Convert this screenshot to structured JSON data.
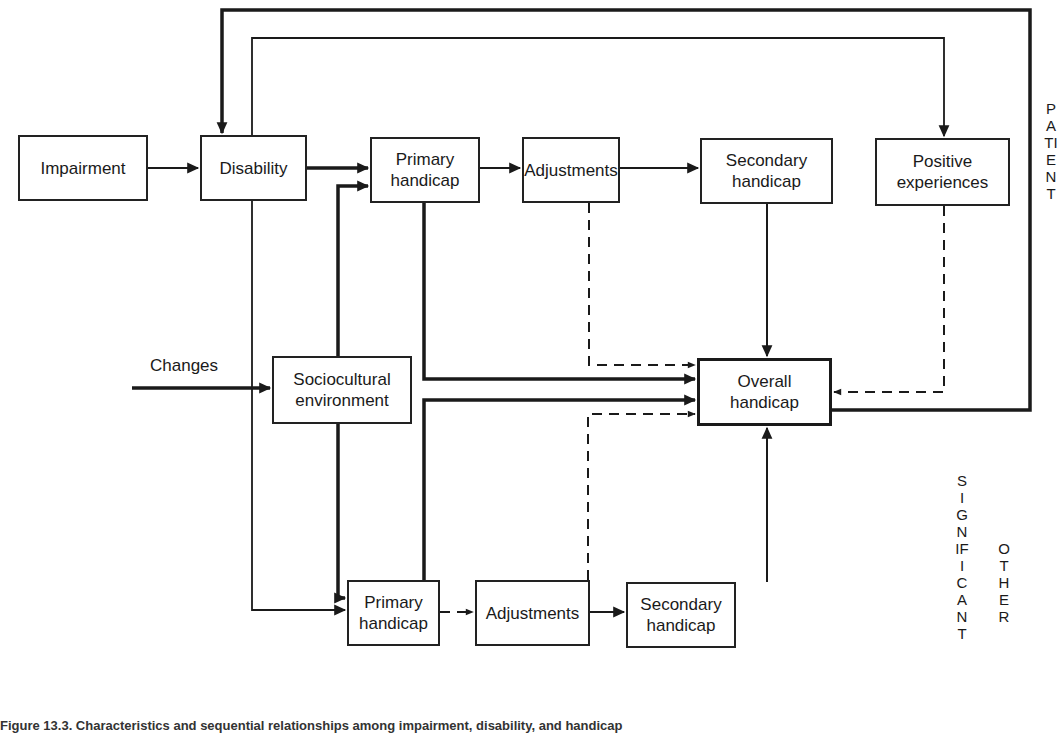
{
  "diagram": {
    "nodes": {
      "impairment": "Impairment",
      "disability": "Disability",
      "primary_handicap_patient_l1": "Primary",
      "primary_handicap_patient_l2": "handicap",
      "adjustments_patient": "Adjustments",
      "secondary_handicap_patient_l1": "Secondary",
      "secondary_handicap_patient_l2": "handicap",
      "positive_experiences_l1": "Positive",
      "positive_experiences_l2": "experiences",
      "sociocultural_l1": "Sociocultural",
      "sociocultural_l2": "environment",
      "overall_handicap_l1": "Overall",
      "overall_handicap_l2": "handicap",
      "primary_handicap_other_l1": "Primary",
      "primary_handicap_other_l2": "handicap",
      "adjustments_other": "Adjustments",
      "secondary_handicap_other_l1": "Secondary",
      "secondary_handicap_other_l2": "handicap"
    },
    "input_label": "Changes",
    "side_labels": {
      "patient": "PATIENT",
      "significant": "SIGNIFICANT",
      "other": "OTHER"
    },
    "legend": {
      "solid_line": "direct effect",
      "dashed_line": "moderating effect"
    },
    "caption": "Figure 13.3. Characteristics and sequential relationships among impairment, disability, and handicap"
  }
}
